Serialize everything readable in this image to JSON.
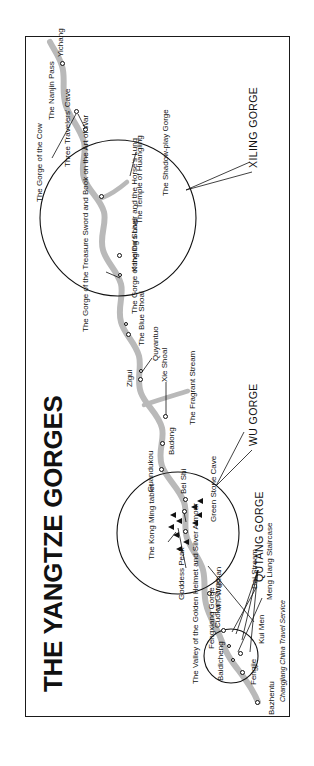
{
  "map": {
    "title": "THE YANGTZE GORGES",
    "credit": "Changjiang China Travel Service",
    "gorge_names": [
      {
        "id": "qutang",
        "label": "QUTANG GORGE"
      },
      {
        "id": "wu",
        "label": "WU GORGE"
      },
      {
        "id": "xiling",
        "label": "XILING GORGE"
      }
    ],
    "main_river_places": [
      {
        "label": "Bazhentu"
      },
      {
        "label": "Fengjie"
      },
      {
        "label": "Baidicheng"
      },
      {
        "label": "Kui Men"
      },
      {
        "label": "Meng Liang Staircase"
      },
      {
        "label": "Fengxiang Gorge"
      },
      {
        "label": "Cuokai Gorge"
      },
      {
        "label": "Dai Stream"
      },
      {
        "label": "MT. Wushan"
      },
      {
        "label": "The Valley of the Golden Helmet and Silver Armour"
      },
      {
        "label": "Guandukou"
      },
      {
        "label": "Badong"
      },
      {
        "label": "Xie Shoal"
      },
      {
        "label": "Zigui"
      },
      {
        "label": "Quyantuo"
      },
      {
        "label": "The Fragrant Stream"
      },
      {
        "label": "Yichang"
      }
    ],
    "wu_inset_labels": [
      {
        "label": "Goddess Peak"
      },
      {
        "label": "The Kong Ming tablet"
      },
      {
        "label": "Bei Shi"
      },
      {
        "label": "Green Stone Cave"
      }
    ],
    "xiling_inset_labels": [
      {
        "label": "The Gorge of the Treasure Sword and Book on the Art of War"
      },
      {
        "label": "The Gorge of the Ox's Liver and the Horse's Lung"
      },
      {
        "label": "The Blue Shoal"
      },
      {
        "label": "Kongling Shoal"
      },
      {
        "label": "The Temple of Huangling"
      },
      {
        "label": "The Shadow-play Gorge"
      },
      {
        "label": "Three Travelers' Cave"
      },
      {
        "label": "The Gorge of the Cow"
      },
      {
        "label": "The Nanjin Pass"
      }
    ],
    "colors": {
      "river": "#b9b9b9",
      "ink": "#111111",
      "paper": "#ffffff"
    }
  }
}
